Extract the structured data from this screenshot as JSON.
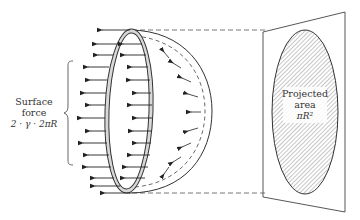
{
  "diagram": {
    "surface_force_label": {
      "line1": "Surface",
      "line2": "force",
      "line3": "2 · γ · 2πR"
    },
    "projected_area_label": {
      "line1": "Projected",
      "line2": "area",
      "line3": "πR²"
    },
    "colors": {
      "stroke": "#333333",
      "ring_fill": "#d8d8d8",
      "hatch": "#777777",
      "background": "#ffffff"
    }
  }
}
